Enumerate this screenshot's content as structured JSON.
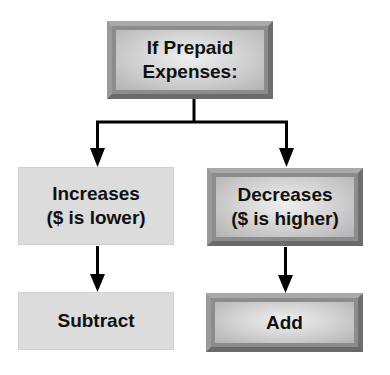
{
  "diagram": {
    "type": "flowchart",
    "colors": {
      "connector": "#000000",
      "bevel_box_frame": "#8c8c8c",
      "bevel_box_fill": "#d6d6d6",
      "flat_box_fill": "#dcdcdc",
      "text": "#111111"
    },
    "nodes": {
      "root": {
        "line1": "If Prepaid",
        "line2": "Expenses:",
        "style": "beveled"
      },
      "increases": {
        "line1": "Increases",
        "line2": "($ is lower)",
        "style": "flat"
      },
      "decreases": {
        "line1": "Decreases",
        "line2": "($ is higher)",
        "style": "beveled"
      },
      "subtract": {
        "label": "Subtract",
        "style": "flat"
      },
      "add": {
        "label": "Add",
        "style": "beveled"
      }
    },
    "edges": [
      {
        "from": "root",
        "to": "increases"
      },
      {
        "from": "root",
        "to": "decreases"
      },
      {
        "from": "increases",
        "to": "subtract"
      },
      {
        "from": "decreases",
        "to": "add"
      }
    ]
  }
}
